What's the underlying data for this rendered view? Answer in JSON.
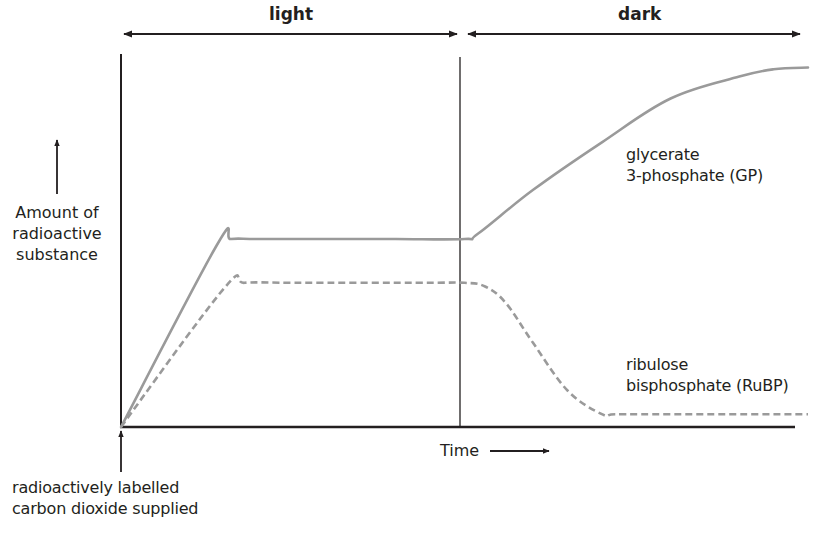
{
  "chart_data": {
    "type": "line",
    "title": "",
    "xlabel": "Time",
    "ylabel": "Amount of radioactive substance",
    "xlim": [
      0,
      100
    ],
    "ylim": [
      0,
      100
    ],
    "grid": false,
    "phases": [
      {
        "name": "light",
        "x_start": 0,
        "x_end": 50
      },
      {
        "name": "dark",
        "x_start": 50,
        "x_end": 100
      }
    ],
    "annotations": [
      {
        "text": "radioactively labelled carbon dioxide supplied",
        "x": 0,
        "position": "below x-axis, arrow pointing up to origin"
      }
    ],
    "series": [
      {
        "name": "glycerate 3-phosphate (GP)",
        "style": "solid",
        "x": [
          0,
          14,
          16,
          20,
          30,
          40,
          50,
          52,
          60,
          70,
          80,
          90,
          95,
          100
        ],
        "values": [
          0,
          50,
          51.5,
          51.5,
          51.5,
          51.5,
          51.5,
          53,
          65,
          78,
          90,
          96,
          98,
          98.5
        ]
      },
      {
        "name": "ribulose bisphosphate (RuBP)",
        "style": "dashed",
        "x": [
          0,
          15,
          18,
          25,
          35,
          45,
          50,
          53,
          56,
          60,
          65,
          70,
          72,
          80,
          90,
          100
        ],
        "values": [
          0,
          38,
          39.5,
          39.5,
          39.5,
          39.5,
          39.5,
          38.5,
          34,
          23,
          10,
          3.5,
          3.5,
          3.5,
          3.5,
          3.5
        ]
      }
    ]
  },
  "labels": {
    "phase_light": "light",
    "phase_dark": "dark",
    "y_axis_line1": "Amount of",
    "y_axis_line2": "radioactive",
    "y_axis_line3": "substance",
    "x_axis": "Time",
    "gp_line1": "glycerate",
    "gp_line2": "3-phosphate (GP)",
    "rubp_line1": "ribulose",
    "rubp_line2": "bisphosphate (RuBP)",
    "co2_line1": "radioactively labelled",
    "co2_line2": "carbon dioxide supplied"
  },
  "colors": {
    "axis": "#231f20",
    "curve": "#9a9a9a"
  }
}
